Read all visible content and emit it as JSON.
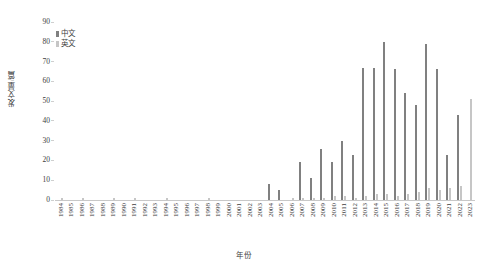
{
  "chart_data": {
    "type": "bar",
    "title": "",
    "xlabel": "年份",
    "ylabel": "发文量/篇",
    "ylim": [
      0,
      90
    ],
    "ytick_step": 10,
    "yticks": [
      90,
      80,
      70,
      60,
      50,
      40,
      30,
      20,
      10,
      0
    ],
    "grid": false,
    "legend_position": "top-left",
    "categories": [
      "1984",
      "1985",
      "1986",
      "1987",
      "1988",
      "1989",
      "1990",
      "1991",
      "1992",
      "1993",
      "1994",
      "1995",
      "1996",
      "1997",
      "1998",
      "1999",
      "2000",
      "2001",
      "2002",
      "2003",
      "2004",
      "2005",
      "2006",
      "2007",
      "2008",
      "2009",
      "2010",
      "2011",
      "2012",
      "2013",
      "2014",
      "2015",
      "2016",
      "2017",
      "2018",
      "2019",
      "2020",
      "2021",
      "2022",
      "2023"
    ],
    "series": [
      {
        "name": "中文",
        "color": "#808080",
        "values": [
          0,
          0,
          0,
          0,
          0,
          0,
          0,
          0,
          0,
          0,
          0,
          0,
          0,
          0,
          0,
          0,
          0,
          0,
          0,
          0,
          8,
          5,
          0,
          19,
          11,
          26,
          19,
          30,
          23,
          67,
          67,
          80,
          66,
          54,
          48,
          79,
          66,
          23,
          43,
          0
        ]
      },
      {
        "name": "英文",
        "color": "#c6c6c6",
        "values": [
          1,
          0,
          1,
          0,
          0,
          1,
          0,
          1,
          0,
          0,
          1,
          0,
          0,
          0,
          1,
          0,
          0,
          0,
          0,
          0,
          0,
          0,
          1,
          1,
          1,
          1,
          2,
          2,
          1,
          2,
          3,
          3,
          2,
          3,
          4,
          6,
          5,
          6,
          7,
          51
        ]
      }
    ]
  },
  "legend": {
    "items": [
      {
        "label": "中文",
        "color": "#808080"
      },
      {
        "label": "英文",
        "color": "#c6c6c6"
      }
    ]
  },
  "axes": {
    "y_title": "发文量/篇",
    "x_title": "年份"
  }
}
